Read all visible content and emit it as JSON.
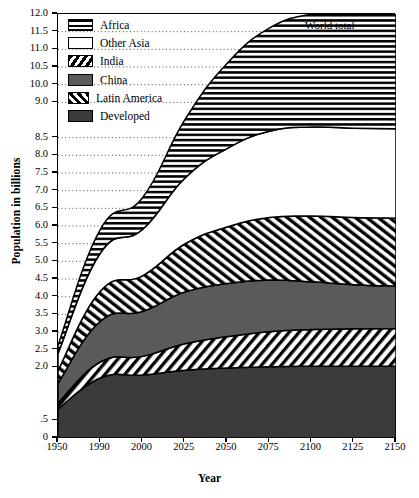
{
  "chart_data": {
    "type": "area",
    "title": "",
    "xlabel": "Year",
    "ylabel": "Population in billions",
    "annotation": "World total",
    "grid": "dotted-horizontal",
    "legend_position": "top-left-inside",
    "stacked": true,
    "x": [
      1950,
      1990,
      2000,
      2025,
      2050,
      2075,
      2100,
      2125,
      2150
    ],
    "xtick_labels": [
      "1950",
      "1990",
      "2000",
      "2025",
      "2050",
      "2075",
      "2100",
      "2125",
      "2150"
    ],
    "xtick_spacing": "equal-pixel",
    "ylim": [
      0,
      12.0
    ],
    "ytick_labels": [
      "12.0",
      "11.5",
      "11.0",
      "10.5",
      "10.0",
      "9.0",
      "8.5",
      "8.0",
      "7.5",
      "7.0",
      "6.5",
      "6.0",
      "5.5",
      "5.0",
      "4.5",
      "4.0",
      "3.5",
      "3.0",
      "2.5",
      "2.0",
      ".5",
      "0"
    ],
    "ytick_values": [
      12.0,
      11.5,
      11.0,
      10.5,
      10.0,
      9.5,
      8.5,
      8.0,
      7.5,
      7.0,
      6.5,
      6.0,
      5.5,
      5.0,
      4.5,
      4.0,
      3.5,
      3.0,
      2.5,
      2.0,
      0.5,
      0.0
    ],
    "series": [
      {
        "name": "Developed",
        "pattern": "solid-dark",
        "color": "#3b3b3b",
        "values": [
          0.82,
          1.7,
          1.78,
          1.92,
          1.98,
          2.02,
          2.03,
          2.03,
          2.03
        ]
      },
      {
        "name": "Latin America",
        "pattern": "forward-hatch",
        "color": "#ffffff",
        "values": [
          0.17,
          0.45,
          0.53,
          0.75,
          0.89,
          0.99,
          1.04,
          1.06,
          1.07
        ]
      },
      {
        "name": "China",
        "pattern": "solid-gray",
        "color": "#5a5a5a",
        "values": [
          0.56,
          1.15,
          1.27,
          1.46,
          1.5,
          1.46,
          1.35,
          1.25,
          1.2
        ]
      },
      {
        "name": "India",
        "pattern": "backward-hatch",
        "color": "#ffffff",
        "values": [
          0.36,
          0.85,
          1.01,
          1.36,
          1.6,
          1.77,
          1.86,
          1.9,
          1.92
        ]
      },
      {
        "name": "Other Asia",
        "pattern": "solid-white",
        "color": "#ffffff",
        "values": [
          0.48,
          1.08,
          1.31,
          1.86,
          2.22,
          2.44,
          2.52,
          2.53,
          2.53
        ]
      },
      {
        "name": "Africa",
        "pattern": "horizontal-stripe",
        "color": "#ffffff",
        "values": [
          0.23,
          0.67,
          0.9,
          1.65,
          2.41,
          2.92,
          3.2,
          3.33,
          3.4
        ]
      }
    ],
    "stack_tops": {
      "Developed": [
        0.82,
        1.7,
        1.78,
        1.92,
        1.98,
        2.02,
        2.03,
        2.03,
        2.03
      ],
      "Latin America": [
        0.99,
        2.15,
        2.31,
        2.67,
        2.87,
        3.01,
        3.07,
        3.09,
        3.1
      ],
      "China": [
        1.55,
        3.3,
        3.58,
        4.13,
        4.37,
        4.47,
        4.42,
        4.34,
        4.3
      ],
      "India": [
        1.91,
        4.15,
        4.59,
        5.49,
        5.97,
        6.24,
        6.28,
        6.24,
        6.22
      ],
      "Other Asia": [
        2.39,
        5.23,
        5.9,
        7.35,
        8.19,
        8.68,
        8.8,
        8.77,
        8.75
      ],
      "World total": [
        2.62,
        5.9,
        6.8,
        9.0,
        10.6,
        11.6,
        12.0,
        12.1,
        12.15
      ]
    },
    "world_total": [
      2.62,
      5.3,
      5.9,
      8.0,
      9.6,
      10.6,
      11.0,
      11.25,
      11.5
    ]
  },
  "legend": {
    "items": [
      {
        "label": "Africa",
        "icon": "swatch-horizontal-stripe"
      },
      {
        "label": "Other Asia",
        "icon": "swatch-white"
      },
      {
        "label": "India",
        "icon": "swatch-backward-hatch"
      },
      {
        "label": "China",
        "icon": "swatch-gray"
      },
      {
        "label": "Latin America",
        "icon": "swatch-forward-hatch"
      },
      {
        "label": "Developed",
        "icon": "swatch-dark"
      }
    ]
  }
}
